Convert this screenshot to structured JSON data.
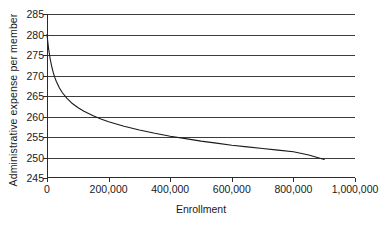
{
  "chart_data": {
    "type": "line",
    "title": "",
    "xlabel": "Enrollment",
    "ylabel": "Administrative expense  per member",
    "xlim": [
      0,
      1000000
    ],
    "ylim": [
      245,
      285
    ],
    "grid": true,
    "grid_axis": "y",
    "legend": "none",
    "xticks": [
      0,
      200000,
      400000,
      600000,
      800000,
      1000000
    ],
    "xtick_labels": [
      "0",
      "200,000",
      "400,000",
      "600,000",
      "800,000",
      "1,000,000"
    ],
    "yticks": [
      245,
      250,
      255,
      260,
      265,
      270,
      275,
      280,
      285
    ],
    "ytick_labels": [
      "245",
      "250",
      "255",
      "260",
      "265",
      "270",
      "275",
      "280",
      "285"
    ],
    "series": [
      {
        "name": "Administrative expense per member",
        "color": "#1a1a1a",
        "x": [
          0,
          5000,
          10000,
          15000,
          20000,
          25000,
          30000,
          40000,
          50000,
          65000,
          80000,
          100000,
          120000,
          150000,
          175000,
          200000,
          250000,
          300000,
          350000,
          400000,
          450000,
          500000,
          550000,
          600000,
          650000,
          700000,
          750000,
          800000,
          850000,
          900000
        ],
        "y": [
          280.0,
          276.6,
          274.2,
          272.3,
          270.8,
          269.6,
          268.6,
          267.0,
          265.8,
          264.4,
          263.3,
          262.2,
          261.3,
          260.2,
          259.4,
          258.7,
          257.6,
          256.7,
          255.9,
          255.2,
          254.6,
          254.0,
          253.5,
          253.0,
          252.6,
          252.2,
          251.8,
          251.4,
          250.6,
          249.5
        ]
      }
    ]
  },
  "axes": {
    "y_title": "Administrative expense  per member",
    "x_title": "Enrollment"
  }
}
